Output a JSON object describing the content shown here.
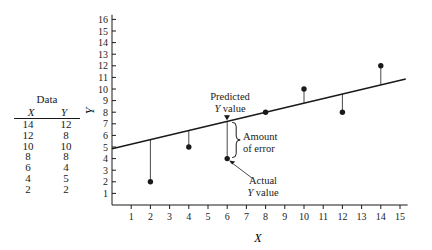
{
  "data_table": {
    "title": "Data",
    "headers": [
      "X",
      "Y"
    ],
    "rows": [
      [
        "14",
        "12"
      ],
      [
        "12",
        "8"
      ],
      [
        "10",
        "10"
      ],
      [
        "8",
        "8"
      ],
      [
        "6",
        "4"
      ],
      [
        "4",
        "5"
      ],
      [
        "2",
        "2"
      ]
    ]
  },
  "annotations": {
    "predicted": [
      "Predicted",
      "Y value"
    ],
    "error": [
      "Amount",
      "of error"
    ],
    "actual": [
      "Actual",
      "Y value"
    ]
  },
  "chart_data": {
    "type": "scatter",
    "title": "",
    "xlabel": "X",
    "ylabel": "Y",
    "xlim": [
      0,
      15
    ],
    "ylim": [
      0,
      16
    ],
    "x_ticks": [
      1,
      2,
      3,
      4,
      5,
      6,
      7,
      8,
      9,
      10,
      11,
      12,
      13,
      14,
      15
    ],
    "y_ticks": [
      1,
      2,
      3,
      4,
      5,
      6,
      7,
      8,
      9,
      10,
      11,
      12,
      13,
      14,
      15,
      16
    ],
    "grid": false,
    "series": [
      {
        "name": "Data points",
        "x": [
          2,
          4,
          6,
          8,
          10,
          12,
          14
        ],
        "y": [
          2,
          5,
          4,
          8,
          10,
          8,
          12
        ]
      }
    ],
    "regression_line": {
      "intercept": 4.857,
      "slope": 0.393,
      "x_range": [
        0,
        15.3
      ]
    },
    "residual_lines": true,
    "annotations": [
      {
        "text": "Predicted Y value",
        "x": 6,
        "y": 7.21
      },
      {
        "text": "Amount of error",
        "x": 6,
        "y_from": 4,
        "y_to": 7.21
      },
      {
        "text": "Actual Y value",
        "x": 6,
        "y": 4
      }
    ]
  }
}
